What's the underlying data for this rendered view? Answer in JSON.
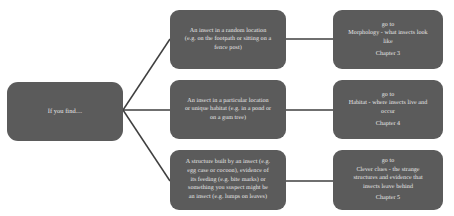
{
  "diagram": {
    "style": {
      "node_fill": "#5b5b5b",
      "node_text": "#e9e9e9",
      "connector": "#3f3f3f",
      "background": "#ffffff"
    },
    "nodes": {
      "start": {
        "name": "start",
        "lines": [
          "If you find...."
        ]
      },
      "random_location": {
        "name": "random-location",
        "lines": [
          "An insect in a random location",
          "(e.g. on the footpath or sitting on a",
          "fence post)"
        ]
      },
      "particular_location": {
        "name": "particular-location",
        "lines": [
          "An insect in a particular location",
          "or unique habitat (e.g. in a pond or",
          "on a gum tree)"
        ]
      },
      "structure_built": {
        "name": "structure-built",
        "lines": [
          "A structure built by an insect (e.g.",
          "egg case or cocoon), evidence of",
          "its feeding (e.g. bite marks) or",
          "something you suspect might be",
          "an insect (e.g. lumps on leaves)"
        ]
      },
      "morphology": {
        "name": "morphology",
        "goto": "go to",
        "lines": [
          "Morphology - what insects look",
          "like"
        ],
        "chapter": "Chapter 3"
      },
      "habitat": {
        "name": "habitat",
        "goto": "go to",
        "lines": [
          "Habitat - where insects live and",
          "occur"
        ],
        "chapter": "Chapter 4"
      },
      "clever_clues": {
        "name": "clever-clues",
        "goto": "go to",
        "lines": [
          "Clever clues - the strange",
          "structures and evidence that",
          "insects leave behind"
        ],
        "chapter": "Chapter 5"
      }
    }
  }
}
